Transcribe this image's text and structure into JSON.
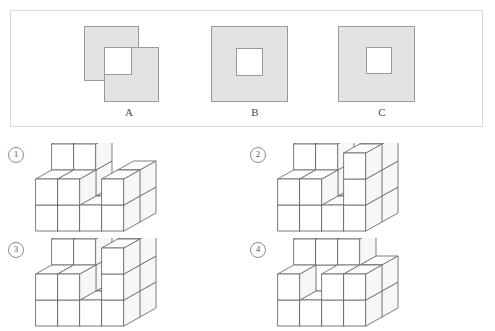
{
  "panel": {
    "name": "shapes-panel",
    "shapes": [
      {
        "id": "A",
        "label": "A",
        "type": "two-overlapping-squares-with-hole",
        "fill": "#e3e3e3",
        "stroke": "#9a9a9a",
        "rects": [
          {
            "x": 84,
            "y": 26,
            "w": 54,
            "h": 54
          },
          {
            "x": 104,
            "y": 47,
            "w": 54,
            "h": 54
          }
        ],
        "hole": {
          "x": 104,
          "y": 47,
          "w": 27,
          "h": 27,
          "fill": "#ffffff"
        },
        "label_x": 114,
        "label_y": 106
      },
      {
        "id": "B",
        "label": "B",
        "type": "square-with-centered-hole",
        "fill": "#e3e3e3",
        "stroke": "#9a9a9a",
        "rects": [
          {
            "x": 211,
            "y": 26,
            "w": 76,
            "h": 75
          }
        ],
        "hole": {
          "x": 236,
          "y": 48,
          "w": 26,
          "h": 27,
          "fill": "#ffffff"
        },
        "label_x": 240,
        "label_y": 106
      },
      {
        "id": "C",
        "label": "C",
        "type": "square-with-centered-hole",
        "fill": "#e3e3e3",
        "stroke": "#9a9a9a",
        "rects": [
          {
            "x": 338,
            "y": 26,
            "w": 76,
            "h": 75
          }
        ],
        "hole": {
          "x": 366,
          "y": 47,
          "w": 25,
          "h": 26,
          "fill": "#ffffff"
        },
        "label_x": 367,
        "label_y": 106
      }
    ]
  },
  "figures": [
    {
      "number": "①",
      "name": "cube-figure-1",
      "caption": "1",
      "num_x": 8,
      "num_y": 147,
      "fig_x": 18,
      "fig_y": 143
    },
    {
      "number": "②",
      "name": "cube-figure-2",
      "caption": "2",
      "num_x": 250,
      "num_y": 147,
      "fig_x": 260,
      "fig_y": 143
    },
    {
      "number": "③",
      "name": "cube-figure-3",
      "caption": "3",
      "num_x": 8,
      "num_y": 242,
      "fig_x": 18,
      "fig_y": 238
    },
    {
      "number": "④",
      "name": "cube-figure-4",
      "caption": "4",
      "num_x": 250,
      "num_y": 242,
      "fig_x": 260,
      "fig_y": 238
    }
  ],
  "colors": {
    "panel_border": "#d8d8d8",
    "shape_fill": "#e3e3e3",
    "shape_stroke": "#9a9a9a",
    "cube_stroke": "#6e6e6e",
    "cube_face": "#ffffff",
    "text": "#4a4a4a",
    "background": "#ffffff"
  }
}
